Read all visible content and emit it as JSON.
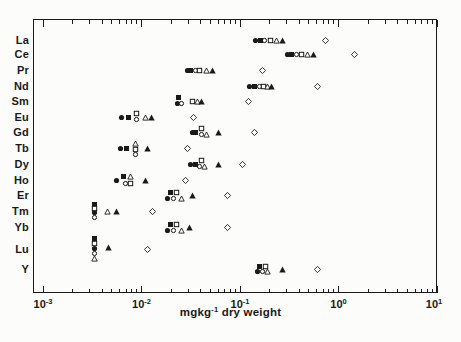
{
  "figure": {
    "colors": {
      "ink": "#1a1a1a",
      "paper": "#fcfcfa"
    },
    "x_axis_label": {
      "prefix": "mgkg",
      "sup": "-1",
      "suffix": " dry weight"
    },
    "x_ticks": [
      {
        "base": "10",
        "exp": "-3"
      },
      {
        "base": "10",
        "exp": "-2"
      },
      {
        "base": "10",
        "exp": "-1"
      },
      {
        "base": "10",
        "exp": "0"
      },
      {
        "base": "10",
        "exp": "1"
      }
    ]
  },
  "chart_data": {
    "type": "scatter",
    "x_scale": "log",
    "x_range": [
      0.001,
      10
    ],
    "xlabel": "mg kg-1 dry weight",
    "grid": false,
    "legend": "none",
    "y_categories": [
      "La",
      "Ce",
      "Pr",
      "Nd",
      "Sm",
      "Eu",
      "Gd",
      "Tb",
      "Dy",
      "Ho",
      "Er",
      "Tm",
      "Yb",
      "Lu",
      "Y"
    ],
    "series": [
      {
        "name": "filled-circle",
        "marker": "filled-circle",
        "points": [
          {
            "el": "La",
            "v": 0.145
          },
          {
            "el": "Ce",
            "v": 0.307
          },
          {
            "el": "Pr",
            "v": 0.029
          },
          {
            "el": "Nd",
            "v": 0.126
          },
          {
            "el": "Sm",
            "v": 0.023,
            "dy": 2
          },
          {
            "el": "Eu",
            "v": 0.0062
          },
          {
            "el": "Gd",
            "v": 0.0326
          },
          {
            "el": "Tb",
            "v": 0.0061
          },
          {
            "el": "Dy",
            "v": 0.0318
          },
          {
            "el": "Ho",
            "v": 0.0056
          },
          {
            "el": "Er",
            "v": 0.0182,
            "dy": 3
          },
          {
            "el": "Tm",
            "v": 0.0033,
            "dy": 1
          },
          {
            "el": "Yb",
            "v": 0.0182,
            "dy": 3
          },
          {
            "el": "Lu",
            "v": 0.0033,
            "dy": -1
          },
          {
            "el": "Y",
            "v": 0.152,
            "dy": 2
          }
        ]
      },
      {
        "name": "open-circle",
        "marker": "open-circle",
        "points": [
          {
            "el": "La",
            "v": 0.179
          },
          {
            "el": "Ce",
            "v": 0.379
          },
          {
            "el": "Pr",
            "v": 0.0357
          },
          {
            "el": "Nd",
            "v": 0.156
          },
          {
            "el": "Sm",
            "v": 0.0252,
            "dy": 2
          },
          {
            "el": "Eu",
            "v": 0.009,
            "dy": 2
          },
          {
            "el": "Gd",
            "v": 0.0402,
            "dy": 2
          },
          {
            "el": "Tb",
            "v": 0.0086,
            "dy": 6
          },
          {
            "el": "Dy",
            "v": 0.0392,
            "dy": 2
          },
          {
            "el": "Ho",
            "v": 0.0068,
            "dy": 3
          },
          {
            "el": "Er",
            "v": 0.0209,
            "dy": 3
          },
          {
            "el": "Tm",
            "v": 0.0033,
            "dy": 6
          },
          {
            "el": "Yb",
            "v": 0.0209,
            "dy": 3
          },
          {
            "el": "Lu",
            "v": 0.0033,
            "dy": 4
          },
          {
            "el": "Y",
            "v": 0.171,
            "dy": 2
          }
        ]
      },
      {
        "name": "filled-square",
        "marker": "filled-square",
        "points": [
          {
            "el": "La",
            "v": 0.16
          },
          {
            "el": "Ce",
            "v": 0.337
          },
          {
            "el": "Pr",
            "v": 0.0318
          },
          {
            "el": "Nd",
            "v": 0.139
          },
          {
            "el": "Sm",
            "v": 0.024,
            "dy": -4
          },
          {
            "el": "Eu",
            "v": 0.0073
          },
          {
            "el": "Gd",
            "v": 0.0357
          },
          {
            "el": "Tb",
            "v": 0.007
          },
          {
            "el": "Dy",
            "v": 0.0357
          },
          {
            "el": "Ho",
            "v": 0.0066,
            "dy": -4
          },
          {
            "el": "Er",
            "v": 0.0195,
            "dy": -3
          },
          {
            "el": "Tm",
            "v": 0.0033,
            "dy": -7
          },
          {
            "el": "Yb",
            "v": 0.0195,
            "dy": -3
          },
          {
            "el": "Lu",
            "v": 0.0033,
            "dy": -11
          },
          {
            "el": "Y",
            "v": 0.156,
            "dy": -3
          }
        ]
      },
      {
        "name": "open-square",
        "marker": "open-square",
        "points": [
          {
            "el": "La",
            "v": 0.202
          },
          {
            "el": "Ce",
            "v": 0.426
          },
          {
            "el": "Pr",
            "v": 0.0392
          },
          {
            "el": "Nd",
            "v": 0.175
          },
          {
            "el": "Sm",
            "v": 0.0326
          },
          {
            "el": "Eu",
            "v": 0.009,
            "dy": -4
          },
          {
            "el": "Gd",
            "v": 0.0411,
            "dy": -4
          },
          {
            "el": "Tb",
            "v": 0.0086,
            "dy": 1
          },
          {
            "el": "Dy",
            "v": 0.0402,
            "dy": -4
          },
          {
            "el": "Ho",
            "v": 0.0078,
            "dy": 3
          },
          {
            "el": "Er",
            "v": 0.0229,
            "dy": -3
          },
          {
            "el": "Tm",
            "v": 0.0033,
            "dy": -3
          },
          {
            "el": "Yb",
            "v": 0.0229,
            "dy": -3
          },
          {
            "el": "Lu",
            "v": 0.0033,
            "dy": -6
          },
          {
            "el": "Y",
            "v": 0.18,
            "dy": -3
          }
        ]
      },
      {
        "name": "open-triangle",
        "marker": "open-triangle",
        "points": [
          {
            "el": "La",
            "v": 0.237
          },
          {
            "el": "Ce",
            "v": 0.49
          },
          {
            "el": "Pr",
            "v": 0.0462
          },
          {
            "el": "Nd",
            "v": 0.192
          },
          {
            "el": "Sm",
            "v": 0.0366
          },
          {
            "el": "Eu",
            "v": 0.0109
          },
          {
            "el": "Gd",
            "v": 0.0452,
            "dy": 2
          },
          {
            "el": "Tb",
            "v": 0.0086,
            "dy": -5
          },
          {
            "el": "Dy",
            "v": 0.0441,
            "dy": 2
          },
          {
            "el": "Ho",
            "v": 0.0078,
            "dy": -4
          },
          {
            "el": "Er",
            "v": 0.0252,
            "dy": 3
          },
          {
            "el": "Tm",
            "v": 0.0045
          },
          {
            "el": "Yb",
            "v": 0.0252,
            "dy": 3
          },
          {
            "el": "Lu",
            "v": 0.0033,
            "dy": 9
          },
          {
            "el": "Y",
            "v": 0.192,
            "dy": 2
          }
        ]
      },
      {
        "name": "filled-triangle",
        "marker": "filled-triangle",
        "points": [
          {
            "el": "La",
            "v": 0.267
          },
          {
            "el": "Ce",
            "v": 0.551
          },
          {
            "el": "Pr",
            "v": 0.052
          },
          {
            "el": "Nd",
            "v": 0.211
          },
          {
            "el": "Sm",
            "v": 0.0411
          },
          {
            "el": "Eu",
            "v": 0.0125
          },
          {
            "el": "Gd",
            "v": 0.0598
          },
          {
            "el": "Tb",
            "v": 0.0116
          },
          {
            "el": "Dy",
            "v": 0.0598
          },
          {
            "el": "Ho",
            "v": 0.0109
          },
          {
            "el": "Er",
            "v": 0.0326
          },
          {
            "el": "Tm",
            "v": 0.0056
          },
          {
            "el": "Yb",
            "v": 0.031
          },
          {
            "el": "Lu",
            "v": 0.0046,
            "dy": -2
          },
          {
            "el": "Y",
            "v": 0.267
          }
        ]
      },
      {
        "name": "open-diamond",
        "marker": "diamond",
        "points": [
          {
            "el": "La",
            "v": 0.746
          },
          {
            "el": "Ce",
            "v": 1.47
          },
          {
            "el": "Pr",
            "v": 0.171
          },
          {
            "el": "Nd",
            "v": 0.619
          },
          {
            "el": "Sm",
            "v": 0.123
          },
          {
            "el": "Eu",
            "v": 0.0341
          },
          {
            "el": "Gd",
            "v": 0.139
          },
          {
            "el": "Tb",
            "v": 0.029
          },
          {
            "el": "Dy",
            "v": 0.107
          },
          {
            "el": "Ho",
            "v": 0.0277
          },
          {
            "el": "Er",
            "v": 0.0738
          },
          {
            "el": "Tm",
            "v": 0.0128
          },
          {
            "el": "Yb",
            "v": 0.0755
          },
          {
            "el": "Lu",
            "v": 0.0114
          },
          {
            "el": "Y",
            "v": 0.619
          }
        ]
      }
    ]
  }
}
